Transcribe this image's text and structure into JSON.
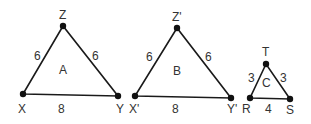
{
  "diagram": {
    "title": "",
    "triangles": [
      {
        "name": "A",
        "vertices": [
          {
            "label": "X",
            "x": 23,
            "y": 94,
            "lx": 18,
            "ly": 113
          },
          {
            "label": "Y",
            "x": 118,
            "y": 96,
            "lx": 116,
            "ly": 113
          },
          {
            "label": "Z",
            "x": 63,
            "y": 26,
            "lx": 59,
            "ly": 19
          }
        ],
        "sides": [
          {
            "label": "6",
            "x": 34,
            "y": 60
          },
          {
            "label": "6",
            "x": 92,
            "y": 60
          },
          {
            "label": "8",
            "x": 58,
            "y": 113
          }
        ],
        "center_label": {
          "text": "A",
          "x": 59,
          "y": 74
        }
      },
      {
        "name": "B",
        "vertices": [
          {
            "label": "X'",
            "x": 135,
            "y": 96,
            "lx": 129,
            "ly": 113
          },
          {
            "label": "Y'",
            "x": 231,
            "y": 98,
            "lx": 227,
            "ly": 113
          },
          {
            "label": "Z'",
            "x": 177,
            "y": 28,
            "lx": 172,
            "ly": 21
          }
        ],
        "sides": [
          {
            "label": "6",
            "x": 146,
            "y": 61
          },
          {
            "label": "6",
            "x": 205,
            "y": 61
          },
          {
            "label": "8",
            "x": 172,
            "y": 113
          }
        ],
        "center_label": {
          "text": "B",
          "x": 173,
          "y": 75
        }
      },
      {
        "name": "C",
        "vertices": [
          {
            "label": "R",
            "x": 250,
            "y": 98,
            "lx": 242,
            "ly": 113
          },
          {
            "label": "S",
            "x": 290,
            "y": 99,
            "lx": 286,
            "ly": 114
          },
          {
            "label": "T",
            "x": 266,
            "y": 64,
            "lx": 262,
            "ly": 56
          }
        ],
        "sides": [
          {
            "label": "3",
            "x": 248,
            "y": 82
          },
          {
            "label": "3",
            "x": 280,
            "y": 82
          },
          {
            "label": "4",
            "x": 265,
            "y": 113
          }
        ],
        "center_label": {
          "text": "C",
          "x": 262,
          "y": 87
        }
      }
    ]
  }
}
